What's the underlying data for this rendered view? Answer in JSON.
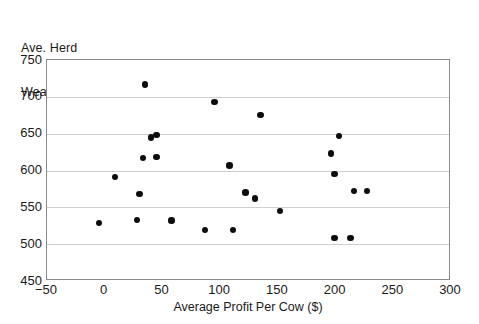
{
  "chart_data": {
    "type": "scatter",
    "title": "",
    "ylabel_line1": "Ave. Herd",
    "ylabel_line2": "Weaning Wt. (lb)",
    "xlabel": "Average Profit Per Cow ($)",
    "xlim": [
      -50,
      300
    ],
    "ylim": [
      450,
      750
    ],
    "xticks": [
      -50,
      0,
      50,
      100,
      150,
      200,
      250,
      300
    ],
    "yticks": [
      450,
      500,
      550,
      600,
      650,
      700,
      750
    ],
    "xtick_labels": [
      "−50",
      "0",
      "50",
      "100",
      "150",
      "200",
      "250",
      "300"
    ],
    "ytick_labels": [
      "450",
      "500",
      "550",
      "600",
      "650",
      "700",
      "750"
    ],
    "grid": "horizontal",
    "legend": "none",
    "marker": "filled-circle",
    "marker_color": "#0d0d0d",
    "gridline_color": "#cfcfcf",
    "axis_color": "#8a8a8a",
    "background": "#ffffff",
    "n_points": 25,
    "points": [
      {
        "x": 35,
        "y": 717
      },
      {
        "x": 95,
        "y": 693
      },
      {
        "x": 135,
        "y": 675
      },
      {
        "x": 40,
        "y": 645
      },
      {
        "x": 45,
        "y": 648
      },
      {
        "x": 203,
        "y": 647
      },
      {
        "x": 33,
        "y": 617
      },
      {
        "x": 45,
        "y": 618
      },
      {
        "x": 108,
        "y": 607
      },
      {
        "x": 196,
        "y": 623
      },
      {
        "x": 199,
        "y": 595
      },
      {
        "x": 9,
        "y": 591
      },
      {
        "x": 30,
        "y": 568
      },
      {
        "x": 122,
        "y": 570
      },
      {
        "x": 216,
        "y": 572
      },
      {
        "x": 227,
        "y": 572
      },
      {
        "x": 130,
        "y": 562
      },
      {
        "x": 152,
        "y": 545
      },
      {
        "x": -5,
        "y": 529
      },
      {
        "x": 28,
        "y": 533
      },
      {
        "x": 58,
        "y": 532
      },
      {
        "x": 87,
        "y": 519
      },
      {
        "x": 111,
        "y": 519
      },
      {
        "x": 199,
        "y": 508
      },
      {
        "x": 213,
        "y": 508
      }
    ]
  }
}
